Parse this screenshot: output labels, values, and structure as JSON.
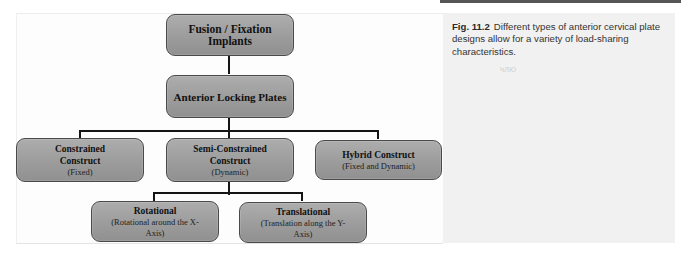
{
  "caption": {
    "figure_label": "Fig. 11.2",
    "text": "Different types of anterior cervical plate designs allow for a variety of load-sharing characteristics.",
    "stamp": "ϞЛЮ"
  },
  "diagram": {
    "root": {
      "title": "Fusion / Fixation Implants"
    },
    "level1": {
      "title": "Anterior Locking Plates"
    },
    "level2": [
      {
        "title": "Constrained Construct",
        "subtitle": "(Fixed)"
      },
      {
        "title": "Semi-Constrained Construct",
        "subtitle": "(Dynamic)"
      },
      {
        "title": "Hybrid Construct",
        "subtitle": "(Fixed and Dynamic)"
      }
    ],
    "level3": [
      {
        "title": "Rotational",
        "subtitle": "(Rotational around the X-Axis)"
      },
      {
        "title": "Translational",
        "subtitle": "(Translation along the Y-Axis)"
      }
    ],
    "colors": {
      "node_fill": "#a3a3a3",
      "node_border": "#4a4a4a",
      "connector": "#151515",
      "caption_bg": "#f1f1f1"
    }
  }
}
